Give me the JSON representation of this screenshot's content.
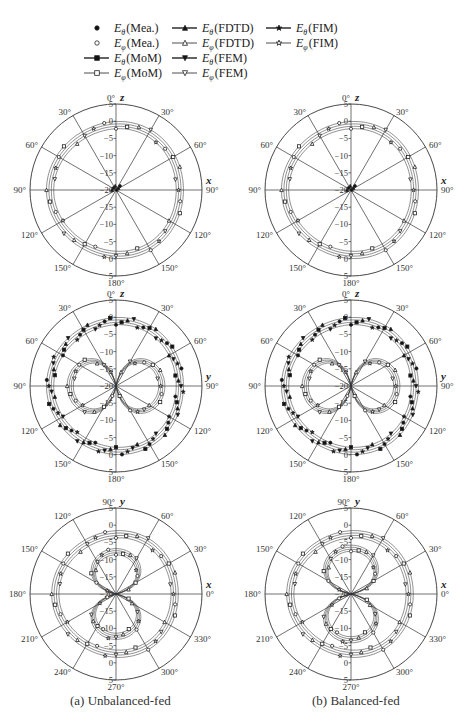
{
  "legend": {
    "entries": [
      {
        "label": "E_θ (Mea.)",
        "sub": "θ",
        "name": "(Mea.)",
        "marker": "filled-circle",
        "line": false,
        "col": 0,
        "row": 0
      },
      {
        "label": "E_φ (Mea.)",
        "sub": "φ",
        "name": "(Mea.)",
        "marker": "open-circle",
        "line": false,
        "col": 0,
        "row": 1
      },
      {
        "label": "E_θ (MoM)",
        "sub": "θ",
        "name": "(MoM)",
        "marker": "filled-square",
        "line": true,
        "col": 0,
        "row": 2
      },
      {
        "label": "E_φ (MoM)",
        "sub": "φ",
        "name": "(MoM)",
        "marker": "open-square",
        "line": true,
        "col": 0,
        "row": 3
      },
      {
        "label": "E_θ (FDTD)",
        "sub": "θ",
        "name": "(FDTD)",
        "marker": "filled-triangle-up",
        "line": true,
        "col": 1,
        "row": 0
      },
      {
        "label": "E_φ (FDTD)",
        "sub": "φ",
        "name": "(FDTD)",
        "marker": "open-triangle-up",
        "line": true,
        "col": 1,
        "row": 1
      },
      {
        "label": "E_θ (FEM)",
        "sub": "θ",
        "name": "(FEM)",
        "marker": "filled-triangle-down",
        "line": true,
        "col": 1,
        "row": 2
      },
      {
        "label": "E_φ (FEM)",
        "sub": "φ",
        "name": "(FEM)",
        "marker": "open-triangle-down",
        "line": true,
        "col": 1,
        "row": 3
      },
      {
        "label": "E_θ (FIM)",
        "sub": "θ",
        "name": "(FIM)",
        "marker": "filled-star",
        "line": true,
        "col": 2,
        "row": 0
      },
      {
        "label": "E_φ (FIM)",
        "sub": "φ",
        "name": "(FIM)",
        "marker": "open-star",
        "line": true,
        "col": 2,
        "row": 1
      }
    ]
  },
  "captions": {
    "a": "(a) Unbalanced-fed",
    "b": "(b) Balanced-fed"
  },
  "chart_data": [
    {
      "type": "polar",
      "id": "a-xz",
      "column": "(a) Unbalanced-fed",
      "plane": "xz",
      "axis_top": "z",
      "axis_right": "x",
      "angle_labels": {
        "top": "0°",
        "tl": "30°",
        "tr": "30°",
        "ul": "60°",
        "ur": "60°",
        "l": "90°",
        "r": "90°",
        "ll": "120°",
        "lr": "120°",
        "bl": "150°",
        "br": "150°",
        "bottom": "180°"
      },
      "radial_ticks": [
        5,
        0,
        -5,
        -10,
        -15,
        -20
      ],
      "rlim": [
        -20,
        5
      ],
      "series": [
        {
          "name": "E_phi (all methods + Mea.)",
          "shape": "circle",
          "level_db": -1.5
        },
        {
          "name": "E_theta (all methods + Mea.)",
          "shape": "null",
          "level_db": -20
        }
      ]
    },
    {
      "type": "polar",
      "id": "b-xz",
      "column": "(b) Balanced-fed",
      "plane": "xz",
      "axis_top": "z",
      "axis_right": "x",
      "angle_labels": {
        "top": "0°",
        "tl": "30°",
        "tr": "30°",
        "ul": "60°",
        "ur": "60°",
        "l": "90°",
        "r": "90°",
        "ll": "120°",
        "lr": "120°",
        "bl": "150°",
        "br": "150°",
        "bottom": "180°"
      },
      "radial_ticks": [
        5,
        0,
        -5,
        -10,
        -15,
        -20
      ],
      "rlim": [
        -20,
        5
      ],
      "series": [
        {
          "name": "E_phi (all methods + Mea.)",
          "shape": "circle",
          "level_db": -1.5
        },
        {
          "name": "E_theta (all methods + Mea.)",
          "shape": "null",
          "level_db": -20
        }
      ]
    },
    {
      "type": "polar",
      "id": "a-yz",
      "column": "(a) Unbalanced-fed",
      "plane": "yz",
      "axis_top": "z",
      "axis_right": "y",
      "angle_labels": {
        "top": "0°",
        "tl": "30°",
        "tr": "30°",
        "ul": "60°",
        "ur": "60°",
        "l": "90°",
        "r": "90°",
        "ll": "120°",
        "lr": "120°",
        "bl": "150°",
        "br": "150°",
        "bottom": "180°"
      },
      "radial_ticks": [
        5,
        0,
        -5,
        -10,
        -15,
        -20
      ],
      "rlim": [
        -20,
        5
      ],
      "series": [
        {
          "name": "E_theta (outer near-circle)",
          "shape": "circle",
          "level_db": -1.5
        },
        {
          "name": "E_phi (figure-eight)",
          "shape": "figure8-horizontal",
          "peak_db": -7
        }
      ]
    },
    {
      "type": "polar",
      "id": "b-yz",
      "column": "(b) Balanced-fed",
      "plane": "yz",
      "axis_top": "z",
      "axis_right": "y",
      "angle_labels": {
        "top": "0°",
        "tl": "30°",
        "tr": "30°",
        "ul": "60°",
        "ur": "60°",
        "l": "90°",
        "r": "90°",
        "ll": "120°",
        "lr": "120°",
        "bl": "150°",
        "br": "150°",
        "bottom": "180°"
      },
      "radial_ticks": [
        5,
        0,
        -5,
        -10,
        -15,
        -20
      ],
      "rlim": [
        -20,
        5
      ],
      "series": [
        {
          "name": "E_theta (outer near-circle)",
          "shape": "circle",
          "level_db": -1.5
        },
        {
          "name": "E_phi (figure-eight)",
          "shape": "figure8-horizontal",
          "peak_db": -7
        }
      ]
    },
    {
      "type": "polar",
      "id": "a-xy",
      "column": "(a) Unbalanced-fed",
      "plane": "xy",
      "axis_top": "y",
      "axis_right": "x",
      "angle_labels": {
        "top": "90°",
        "tl": "120°",
        "tr": "60°",
        "ul": "150°",
        "ur": "30°",
        "l": "180°",
        "r": "0°",
        "ll": "210°",
        "lr": "330°",
        "bl": "240°",
        "br": "300°",
        "bottom": "270°"
      },
      "radial_ticks": [
        5,
        0,
        -5,
        -10,
        -15,
        -20
      ],
      "rlim": [
        -20,
        5
      ],
      "series": [
        {
          "name": "E_phi (outer, ~-3 dB)",
          "shape": "circle",
          "level_db": -3
        },
        {
          "name": "E_theta (figure-eight vertical, tilted)",
          "shape": "figure8-vertical",
          "peak_db": -8
        }
      ]
    },
    {
      "type": "polar",
      "id": "b-xy",
      "column": "(b) Balanced-fed",
      "plane": "xy",
      "axis_top": "y",
      "axis_right": "x",
      "angle_labels": {
        "top": "90°",
        "tl": "120°",
        "tr": "60°",
        "ul": "150°",
        "ur": "30°",
        "l": "180°",
        "r": "0°",
        "ll": "210°",
        "lr": "330°",
        "bl": "240°",
        "br": "300°",
        "bottom": "270°"
      },
      "radial_ticks": [
        5,
        0,
        -5,
        -10,
        -15,
        -20
      ],
      "rlim": [
        -20,
        5
      ],
      "series": [
        {
          "name": "E_phi (outer, ~-3 dB)",
          "shape": "circle",
          "level_db": -3
        },
        {
          "name": "E_theta (figure-eight vertical)",
          "shape": "figure8-vertical",
          "peak_db": -7
        }
      ]
    }
  ]
}
